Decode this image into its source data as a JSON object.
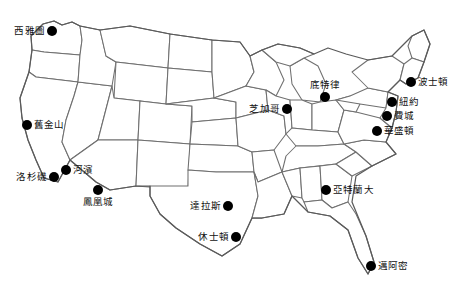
{
  "map": {
    "title": "United States city map with Traditional Chinese city labels",
    "background_color": "#ffffff",
    "state_border_color": "#6f6f6f",
    "outline_color": "#5a5a5a",
    "marker_color": "#000000",
    "label_color": "#111111"
  },
  "cities": [
    {
      "label": "西雅圖",
      "x": 52,
      "y": 31,
      "label_position": "left"
    },
    {
      "label": "舊金山",
      "x": 27,
      "y": 125,
      "label_position": "right"
    },
    {
      "label": "河濱",
      "x": 66,
      "y": 170,
      "label_position": "right"
    },
    {
      "label": "洛杉磯",
      "x": 54,
      "y": 177,
      "label_position": "left"
    },
    {
      "label": "鳳凰城",
      "x": 98,
      "y": 190,
      "label_position": "below"
    },
    {
      "label": "達拉斯",
      "x": 228,
      "y": 206,
      "label_position": "left"
    },
    {
      "label": "休士頓",
      "x": 236,
      "y": 237,
      "label_position": "left"
    },
    {
      "label": "芝加哥",
      "x": 287,
      "y": 109,
      "label_position": "left"
    },
    {
      "label": "底特律",
      "x": 325,
      "y": 97,
      "label_position": "above"
    },
    {
      "label": "波士頓",
      "x": 411,
      "y": 82,
      "label_position": "right"
    },
    {
      "label": "紐約",
      "x": 392,
      "y": 102,
      "label_position": "right"
    },
    {
      "label": "費城",
      "x": 387,
      "y": 116,
      "label_position": "right"
    },
    {
      "label": "華盛頓",
      "x": 377,
      "y": 131,
      "label_position": "right"
    },
    {
      "label": "亞特蘭大",
      "x": 326,
      "y": 190,
      "label_position": "right"
    },
    {
      "label": "邁阿密",
      "x": 371,
      "y": 266,
      "label_position": "right"
    }
  ]
}
